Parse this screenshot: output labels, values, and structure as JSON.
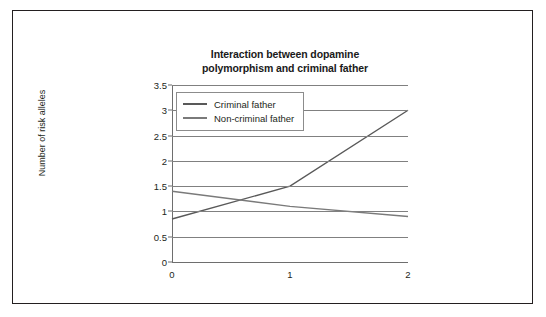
{
  "chart_data": {
    "type": "line",
    "title": "Interaction between dopamine polymorphism and criminal father",
    "title_lines": [
      "Interaction between dopamine",
      "polymorphism and criminal father"
    ],
    "xlabel": "",
    "ylabel": "Number of risk alleles",
    "categories": [
      "0",
      "1",
      "2"
    ],
    "x": [
      0,
      1,
      2
    ],
    "ylim": [
      0,
      3.5
    ],
    "yticks": [
      "0",
      "0.5",
      "1",
      "1.5",
      "2",
      "2.5",
      "3",
      "3.5"
    ],
    "ytick_values": [
      0,
      0.5,
      1,
      1.5,
      2,
      2.5,
      3,
      3.5
    ],
    "grid": "horizontal",
    "legend_position": "top-left",
    "series": [
      {
        "name": "Criminal father",
        "values": [
          0.85,
          1.5,
          3.0
        ],
        "color": "#595959"
      },
      {
        "name": "Non-criminal father",
        "values": [
          1.4,
          1.1,
          0.9
        ],
        "color": "#7a7a7a"
      }
    ]
  },
  "colors": {
    "frame": "#231f20",
    "gridline": "#808080",
    "axis": "#6e6e6e",
    "text": "#231f20",
    "background": "#ffffff",
    "legend_border": "#8c8c8c"
  }
}
